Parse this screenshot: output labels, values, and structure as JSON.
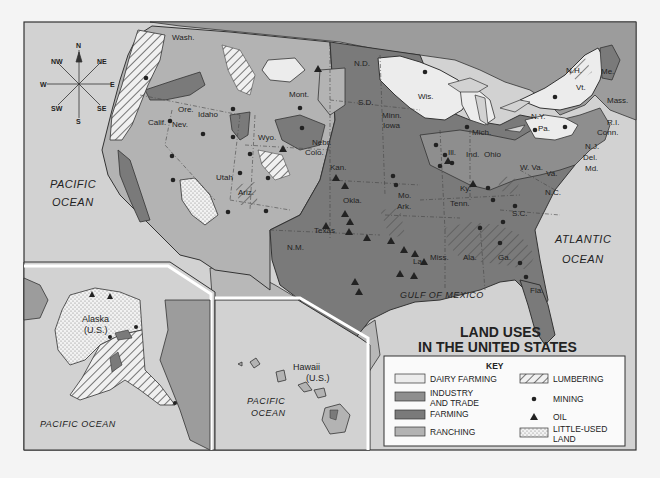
{
  "map": {
    "title_line1": "LAND USES",
    "title_line2": "IN THE UNITED STATES",
    "colors": {
      "ocean": "#d2d2d2",
      "dairy_farming": "#ececec",
      "industry_and_trade": "#8e8e8e",
      "farming": "#7a7a7a",
      "ranching": "#b3b3b3",
      "canada_mexico": "#9c9c9c",
      "border": "#333333"
    },
    "compass": {
      "n": "N",
      "ne": "NE",
      "e": "E",
      "se": "SE",
      "s": "S",
      "sw": "SW",
      "w": "W",
      "nw": "NW"
    },
    "oceans": {
      "pacific_line1": "PACIFIC",
      "pacific_line2": "OCEAN",
      "atlantic_line1": "ATLANTIC",
      "atlantic_line2": "OCEAN",
      "gulf": "GULF OF MEXICO",
      "alaska_pacific": "PACIFIC OCEAN",
      "hawaii_pacific_line1": "PACIFIC",
      "hawaii_pacific_line2": "OCEAN"
    },
    "states": {
      "wash": "Wash.",
      "ore": "Ore.",
      "idaho": "Idaho",
      "calif": "Calif.",
      "nev": "Nev.",
      "mont": "Mont.",
      "wyo": "Wyo.",
      "utah": "Utah",
      "ariz": "Ariz.",
      "colo": "Colo.",
      "nm": "N.M.",
      "nd": "N.D.",
      "sd": "S.D.",
      "nebr": "Nebr.",
      "kan": "Kan.",
      "okla": "Okla.",
      "texas": "Texas",
      "minn": "Minn.",
      "iowa": "Iowa",
      "mo": "Mo.",
      "ark": "Ark.",
      "la": "La.",
      "wis": "Wis.",
      "ill": "Ill.",
      "mich": "Mich.",
      "ind": "Ind.",
      "ohio": "Ohio",
      "ky": "Ky.",
      "tenn": "Tenn.",
      "miss": "Miss.",
      "ala": "Ala.",
      "ga": "Ga.",
      "fla": "Fla.",
      "sc": "S.C.",
      "nc": "N.C.",
      "va": "Va.",
      "wva": "W. Va.",
      "pa": "Pa.",
      "ny": "N.Y.",
      "vt": "Vt.",
      "nh": "N.H.",
      "me": "Me.",
      "mass": "Mass.",
      "ri": "R.I.",
      "conn": "Conn.",
      "nj": "N.J.",
      "del": "Del.",
      "md": "Md."
    },
    "insets": {
      "alaska_line1": "Alaska",
      "alaska_line2": "(U.S.)",
      "hawaii_line1": "Hawaii",
      "hawaii_line2": "(U.S.)"
    }
  },
  "legend": {
    "heading": "KEY",
    "items": [
      {
        "label": "DAIRY FARMING",
        "symbol": "swatch-dairy"
      },
      {
        "label_line1": "INDUSTRY",
        "label_line2": "AND TRADE",
        "symbol": "swatch-industry"
      },
      {
        "label": "FARMING",
        "symbol": "swatch-farming"
      },
      {
        "label": "RANCHING",
        "symbol": "swatch-ranching"
      },
      {
        "label": "LUMBERING",
        "symbol": "hatch-pattern"
      },
      {
        "label": "MINING",
        "symbol": "dot"
      },
      {
        "label": "OIL",
        "symbol": "triangle"
      },
      {
        "label_line1": "LITTLE-USED",
        "label_line2": "LAND",
        "symbol": "stipple-pattern"
      }
    ]
  }
}
